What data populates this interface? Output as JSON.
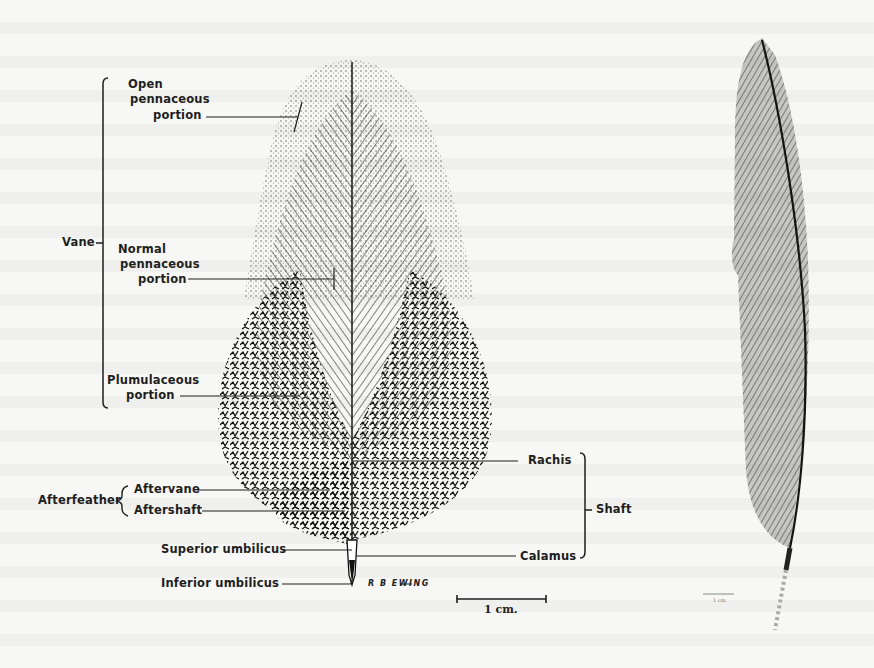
{
  "figure": {
    "main_feather": {
      "labels": {
        "vane": "Vane",
        "open_pennaceous_1": "Open",
        "open_pennaceous_2": "pennaceous",
        "open_pennaceous_3": "portion",
        "normal_pennaceous_1": "Normal",
        "normal_pennaceous_2": "pennaceous",
        "normal_pennaceous_3": "portion",
        "plumulaceous_1": "Plumulaceous",
        "plumulaceous_2": "portion",
        "afterfeather": "Afterfeather",
        "aftervane": "Aftervane",
        "aftershaft": "Aftershaft",
        "superior_umbilicus": "Superior umbilicus",
        "inferior_umbilicus": "Inferior umbilicus",
        "rachis": "Rachis",
        "calamus": "Calamus",
        "shaft": "Shaft"
      },
      "signature": "R B EWING",
      "scale_bar": {
        "label": "1 cm."
      }
    },
    "secondary_feather": {
      "scale_bar": {
        "label": "1 cm."
      }
    },
    "colors": {
      "ink": "#1e1e1e",
      "paper": "#f7f7f5",
      "secondary_feather_fill": "#7a7a7a",
      "secondary_feather_shaft": "#1a1a1a"
    }
  }
}
